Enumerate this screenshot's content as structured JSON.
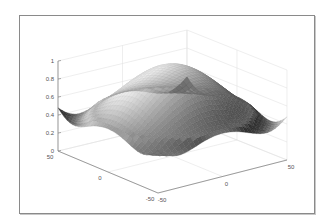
{
  "chart_data": {
    "type": "surface",
    "title": "",
    "xlabel": "",
    "ylabel": "",
    "zlabel": "",
    "function": "radially symmetric peak: z ≈ 0.5 + 0.5*cos(pi*r/R) style, max ≈ 1 at center, ≈ 0.45–0.5 at edges, minimum near edge midpoints",
    "xlim": [
      -50,
      50
    ],
    "ylim": [
      -50,
      50
    ],
    "zlim": [
      0,
      1
    ],
    "x_ticks": [
      "-50",
      "0",
      "50"
    ],
    "y_ticks": [
      "50",
      "0",
      "-50"
    ],
    "z_ticks": [
      "0",
      "0.2",
      "0.4",
      "0.6",
      "0.8",
      "1"
    ],
    "grid": true,
    "colormap": "gray",
    "peak": {
      "x": 0,
      "y": 0,
      "z": 1
    },
    "edge_level": 0.48
  }
}
